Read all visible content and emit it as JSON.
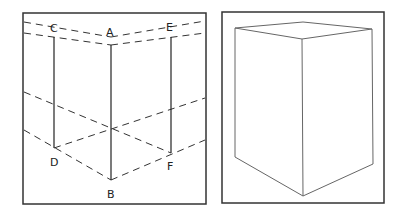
{
  "left_panel": {
    "labels": {
      "C": "C",
      "A": "A",
      "E": "E",
      "D": "D",
      "B": "B",
      "F": "F"
    }
  },
  "right_panel": {},
  "colors": {
    "stroke": "#222222",
    "frame": "#333333",
    "box_stroke": "#666666"
  }
}
